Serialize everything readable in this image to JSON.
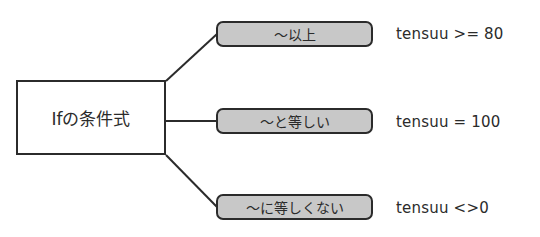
{
  "diagram": {
    "root": {
      "label": "Ifの条件式"
    },
    "branches": [
      {
        "label": "～以上",
        "example": "tensuu >= 80"
      },
      {
        "label": "～と等しい",
        "example": "tensuu = 100"
      },
      {
        "label": "～に等しくない",
        "example": "tensuu <>0"
      }
    ],
    "colors": {
      "stroke": "#2b2b2b",
      "pill_fill": "#c8c8c8",
      "background": "#ffffff"
    }
  }
}
